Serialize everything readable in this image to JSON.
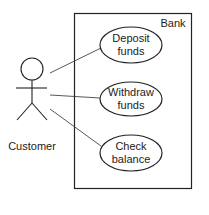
{
  "diagram": {
    "type": "uml-use-case",
    "system": {
      "label": "Bank"
    },
    "actor": {
      "label": "Customer"
    },
    "use_cases": [
      {
        "line1": "Deposit",
        "line2": "funds"
      },
      {
        "line1": "Withdraw",
        "line2": "funds"
      },
      {
        "line1": "Check",
        "line2": "balance"
      }
    ],
    "colors": {
      "stroke": "#222222",
      "background": "#ffffff"
    }
  }
}
